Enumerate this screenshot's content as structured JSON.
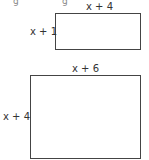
{
  "diagram": {
    "top_artifacts": [
      "g",
      "g"
    ],
    "rectangles": [
      {
        "id": "small",
        "width_label": "x + 4",
        "height_label": "x + 1"
      },
      {
        "id": "large",
        "width_label": "x + 6",
        "height_label": "x + 4"
      }
    ],
    "colors": {
      "stroke": "#444444",
      "text": "#333333",
      "background": "#ffffff"
    }
  }
}
